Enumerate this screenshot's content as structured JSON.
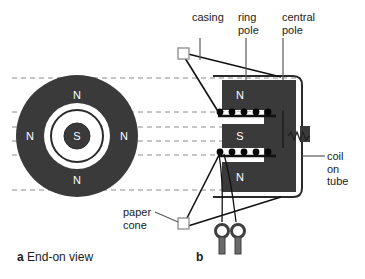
{
  "figure": {
    "title_semantic": "loudspeaker-construction-diagram",
    "background": "#ffffff",
    "ink": "#1a1a1a",
    "magnet_fill": "#3a3a3a",
    "dash_color": "#8c8c8c",
    "width": 365,
    "height": 279
  },
  "captions": {
    "a_letter": "a",
    "a_text": "End-on view",
    "b_letter": "b",
    "b_text": ""
  },
  "labels": {
    "casing": "casing",
    "ring_pole": "ring\npole",
    "central_pole": "central\npole",
    "coil_on_tube": "coil\non\ntube",
    "paper_cone": "paper\ncone"
  },
  "panel_a": {
    "name": "end-on-view",
    "center": {
      "x": 77,
      "y": 136
    },
    "outer_radius": 61,
    "white_gap_outer_radius": 33,
    "thin_ring_radius": 26,
    "white_gap_inner_radius": 20,
    "core_radius": 13,
    "pole_markers": [
      {
        "text": "N",
        "x": 77,
        "y": 95,
        "color": "#ffffff"
      },
      {
        "text": "N",
        "x": 30,
        "y": 136,
        "color": "#ffffff"
      },
      {
        "text": "N",
        "x": 124,
        "y": 136,
        "color": "#ffffff"
      },
      {
        "text": "N",
        "x": 77,
        "y": 180,
        "color": "#ffffff"
      },
      {
        "text": "S",
        "x": 77,
        "y": 136,
        "color": "#ffffff"
      }
    ]
  },
  "panel_b": {
    "name": "cross-section-view",
    "pole_markers": [
      {
        "text": "N",
        "x": 240,
        "y": 95,
        "color": "#ffffff"
      },
      {
        "text": "S",
        "x": 240,
        "y": 136,
        "color": "#ffffff"
      },
      {
        "text": "N",
        "x": 240,
        "y": 177,
        "color": "#ffffff"
      }
    ],
    "coil_turns_upper": 5,
    "coil_turns_lower": 5,
    "terminals": 2,
    "casing_outline": "rounded-rectangle"
  },
  "projection_lines": {
    "name": "dashed-projection-lines",
    "count": 6,
    "y_values": [
      78,
      112,
      127,
      141,
      155,
      190
    ],
    "x_start": 12,
    "x_end": 300,
    "style": "dashed"
  }
}
